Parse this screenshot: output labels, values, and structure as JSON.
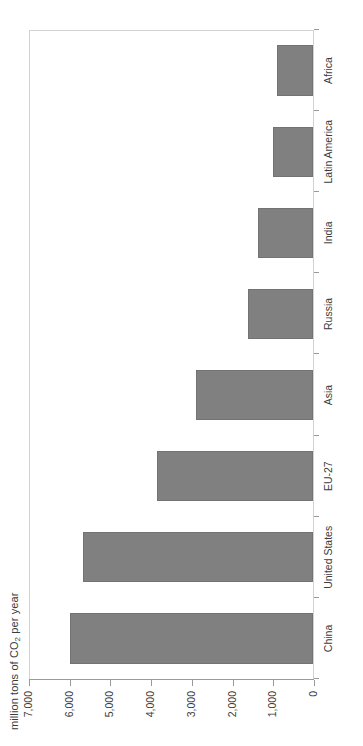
{
  "chart_data": {
    "type": "bar",
    "orientation": "horizontal-rotated",
    "title": "",
    "xlabel": "",
    "ylabel": "million tons of CO2 per year",
    "ylabel_parts": {
      "pre": "million tons of CO",
      "sub": "2",
      "post": " per year"
    },
    "categories": [
      "China",
      "United States",
      "EU-27",
      "Asia",
      "Russia",
      "India",
      "Latin America",
      "Africa"
    ],
    "values": [
      6000,
      5700,
      3850,
      2900,
      1600,
      1350,
      1000,
      900
    ],
    "ylim": [
      0,
      7000
    ],
    "tick_labels": [
      "7,000",
      "6,000",
      "5,000",
      "4,000",
      "3,000",
      "2,000",
      "1,000",
      "0"
    ],
    "tick_values": [
      7000,
      6000,
      5000,
      4000,
      3000,
      2000,
      1000,
      0
    ],
    "axis_direction": "reversed",
    "grid": false,
    "legend": "none",
    "bar_color": "#808080",
    "bar_border_color": "#737373",
    "axis_color": "#9a9a9a",
    "plot_border_color": "#d2d2d2",
    "text_color": "#3b3b3b"
  }
}
